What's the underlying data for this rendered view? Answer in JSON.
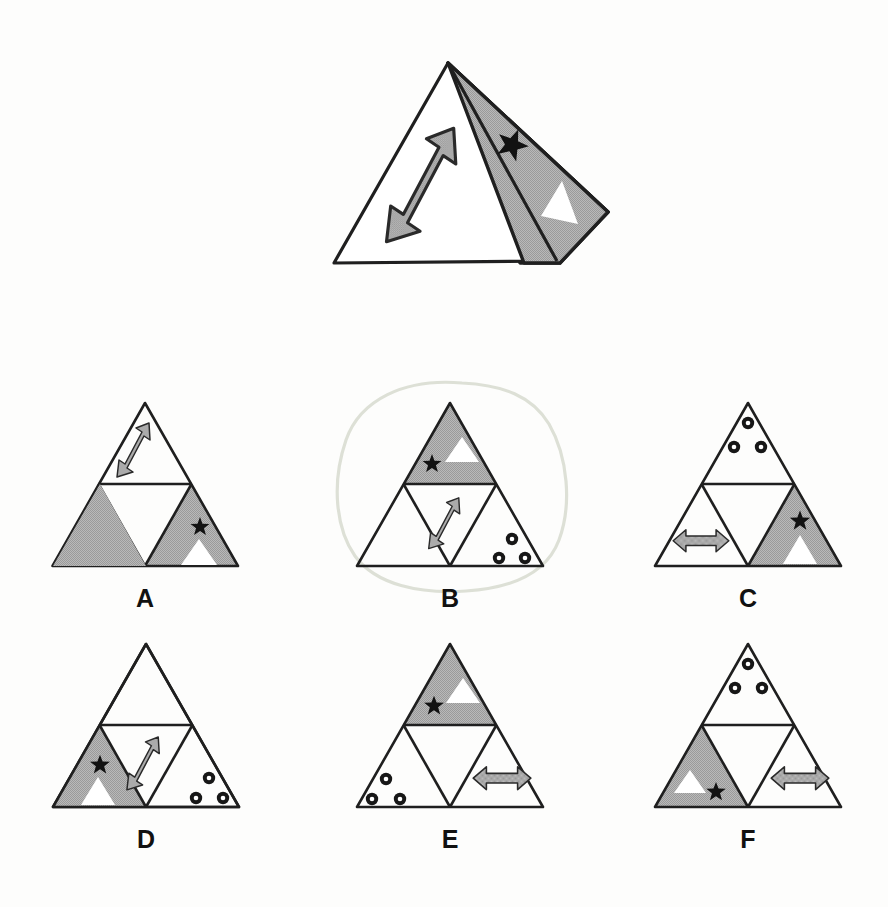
{
  "page": {
    "background_color": "#fdfdfc",
    "width": 888,
    "height": 907
  },
  "palette": {
    "ink": "#1a1a1a",
    "gray_fill": "#a8a8a8",
    "gray_fill_light": "#b4b4b4",
    "white": "#ffffff",
    "black": "#111111",
    "pencil_mark": "#d9dcd2"
  },
  "prompt_figure": {
    "name": "unfolded-triangle-with-flap",
    "description": "Large outlined triangle with a shaded quadrilateral flap folded out to the right side",
    "icons": [
      {
        "icon": "diagonal-double-arrow-icon",
        "fill": "gray",
        "location": "interior-left"
      },
      {
        "icon": "star-icon",
        "fill": "black",
        "location": "flap"
      },
      {
        "icon": "white-triangle-icon",
        "fill": "white",
        "location": "flap"
      }
    ]
  },
  "options": [
    {
      "id": "A",
      "label": "A",
      "selected": false,
      "shaded_cell": "bottom-right",
      "icons": [
        {
          "icon": "diagonal-double-arrow-icon",
          "cell": "top"
        },
        {
          "icon": "three-circles-icon",
          "cell": "bottom-left"
        },
        {
          "icon": "star-icon",
          "cell": "bottom-right"
        },
        {
          "icon": "white-triangle-icon",
          "cell": "bottom-right"
        }
      ]
    },
    {
      "id": "B",
      "label": "B",
      "selected": true,
      "selection_mark": "hand-drawn-circle",
      "shaded_cell": "top",
      "icons": [
        {
          "icon": "star-icon",
          "cell": "top"
        },
        {
          "icon": "white-triangle-icon",
          "cell": "top"
        },
        {
          "icon": "diagonal-double-arrow-icon",
          "cell": "center-inverted"
        },
        {
          "icon": "three-circles-icon",
          "cell": "bottom-right"
        }
      ]
    },
    {
      "id": "C",
      "label": "C",
      "selected": false,
      "shaded_cell": "bottom-right",
      "icons": [
        {
          "icon": "three-circles-icon",
          "cell": "top"
        },
        {
          "icon": "horizontal-double-arrow-icon",
          "cell": "bottom-left"
        },
        {
          "icon": "star-icon",
          "cell": "bottom-right"
        },
        {
          "icon": "white-triangle-icon",
          "cell": "bottom-right"
        }
      ]
    },
    {
      "id": "D",
      "label": "D",
      "selected": false,
      "shaded_cell": "bottom-left",
      "icons": [
        {
          "icon": "star-icon",
          "cell": "bottom-left"
        },
        {
          "icon": "white-triangle-icon",
          "cell": "bottom-left"
        },
        {
          "icon": "diagonal-double-arrow-icon",
          "cell": "center-inverted"
        },
        {
          "icon": "three-circles-icon",
          "cell": "bottom-right"
        }
      ]
    },
    {
      "id": "E",
      "label": "E",
      "selected": false,
      "shaded_cell": "top",
      "icons": [
        {
          "icon": "star-icon",
          "cell": "top"
        },
        {
          "icon": "white-triangle-icon",
          "cell": "top"
        },
        {
          "icon": "three-circles-icon",
          "cell": "bottom-left"
        },
        {
          "icon": "horizontal-double-arrow-icon",
          "cell": "bottom-right"
        }
      ]
    },
    {
      "id": "F",
      "label": "F",
      "selected": false,
      "shaded_cell": "bottom-left",
      "icons": [
        {
          "icon": "three-circles-icon",
          "cell": "top"
        },
        {
          "icon": "white-triangle-icon",
          "cell": "bottom-left"
        },
        {
          "icon": "star-icon",
          "cell": "bottom-left"
        },
        {
          "icon": "horizontal-double-arrow-icon",
          "cell": "bottom-right"
        }
      ]
    }
  ]
}
